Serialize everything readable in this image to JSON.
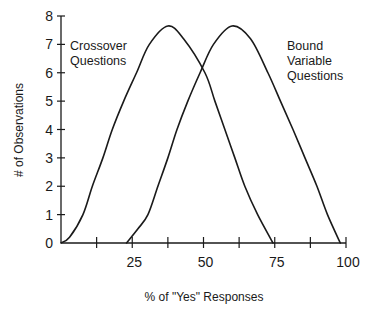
{
  "chart_data": {
    "type": "line",
    "title": "",
    "xlabel": "% of \"Yes\" Responses",
    "ylabel": "# of Observations",
    "xlim": [
      0,
      100
    ],
    "ylim": [
      0,
      8
    ],
    "x_ticks": [
      0,
      12.5,
      25,
      37.5,
      50,
      62.5,
      75,
      87.5,
      100
    ],
    "x_tick_labels": [
      {
        "value": 25,
        "label": "25"
      },
      {
        "value": 50,
        "label": "50"
      },
      {
        "value": 75,
        "label": "75"
      },
      {
        "value": 100,
        "label": "100"
      }
    ],
    "y_ticks": [
      0,
      1,
      2,
      3,
      4,
      5,
      6,
      7,
      8
    ],
    "y_tick_labels": [
      "0",
      "1",
      "2",
      "3",
      "4",
      "5",
      "6",
      "7",
      "8"
    ],
    "grid": false,
    "legend": "none (inline annotations)",
    "series": [
      {
        "name": "Crossover Questions",
        "annotation": [
          "Crossover",
          "Questions"
        ],
        "points": [
          [
            0,
            0
          ],
          [
            3,
            0.2
          ],
          [
            7.7,
            1
          ],
          [
            11,
            2
          ],
          [
            14.7,
            3
          ],
          [
            18,
            4
          ],
          [
            22,
            5
          ],
          [
            26.5,
            6
          ],
          [
            31,
            7
          ],
          [
            37.5,
            7.65
          ],
          [
            43,
            7.2
          ],
          [
            50.5,
            6
          ],
          [
            54,
            5
          ],
          [
            57.5,
            4
          ],
          [
            61,
            3
          ],
          [
            64.5,
            2
          ],
          [
            69,
            1
          ],
          [
            74.4,
            0
          ]
        ]
      },
      {
        "name": "Bound Variable Questions",
        "annotation": [
          "Bound",
          "Variable",
          "Questions"
        ],
        "points": [
          [
            23,
            0
          ],
          [
            27,
            0.5
          ],
          [
            30.5,
            1
          ],
          [
            34,
            2
          ],
          [
            37.5,
            3
          ],
          [
            40.7,
            4
          ],
          [
            44.5,
            5
          ],
          [
            48.8,
            6
          ],
          [
            53.5,
            7
          ],
          [
            60,
            7.65
          ],
          [
            66.5,
            7.2
          ],
          [
            72.6,
            6
          ],
          [
            77,
            5
          ],
          [
            81.4,
            4
          ],
          [
            85.6,
            3
          ],
          [
            89.8,
            2
          ],
          [
            93.5,
            1
          ],
          [
            98,
            0
          ]
        ]
      }
    ],
    "intersection": {
      "x": 49,
      "y": 6.05
    },
    "peaks": [
      {
        "series": "Crossover Questions",
        "x": 37.5,
        "y": 7.65
      },
      {
        "series": "Bound Variable Questions",
        "x": 60,
        "y": 7.65
      }
    ]
  },
  "style": {
    "line_color": "#1a1a1a",
    "background": "#ffffff"
  }
}
